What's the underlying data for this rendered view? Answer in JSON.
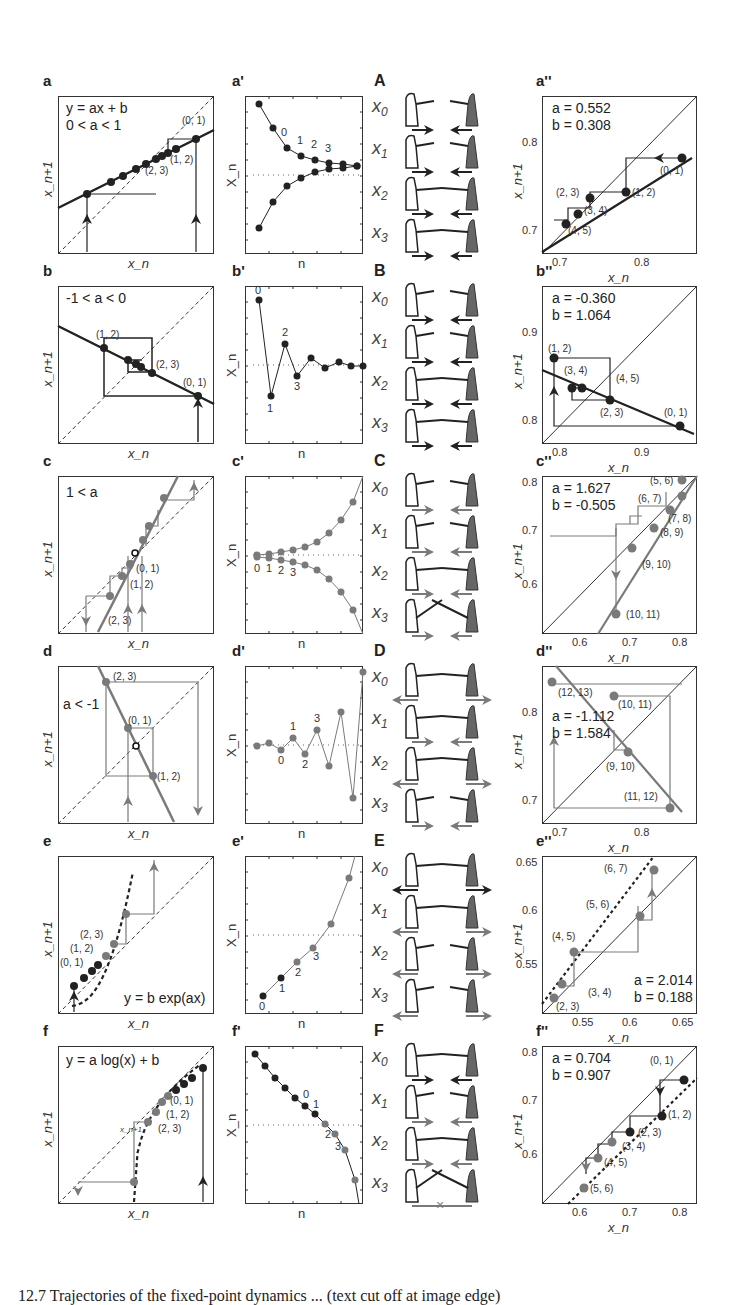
{
  "figure": {
    "caption": "12.7 Trajectories of the fixed-point dynamics ... (text cut off at image edge)",
    "axis_labels": {
      "cobweb_x": "x_n",
      "cobweb_y": "x_n+1",
      "time_x": "n",
      "time_y": "X_n"
    }
  },
  "rows": [
    {
      "cobweb": {
        "label": "a",
        "equation_line1": "y = ax + b",
        "equation_line2": "0 < a < 1",
        "points": [
          "(0, 1)",
          "(1, 2)",
          "(2, 3)"
        ]
      },
      "timeseries": {
        "label": "a'",
        "indices": [
          "0",
          "1",
          "2",
          "3"
        ]
      },
      "schematic": {
        "label": "A",
        "states": [
          "x0",
          "x1",
          "x2",
          "x3"
        ]
      },
      "fit": {
        "label": "a''",
        "a": "a = 0.552",
        "b": "b = 0.308",
        "xticks": [
          "0.7",
          "0.8"
        ],
        "yticks": [
          "0.8",
          "0.7"
        ],
        "points": [
          "(0, 1)",
          "(1, 2)",
          "(2, 3)",
          "(3, 4)",
          "(4, 5)"
        ]
      }
    },
    {
      "cobweb": {
        "label": "b",
        "equation_line1": "-1 < a < 0",
        "points": [
          "(1, 2)",
          "(2, 3)",
          "(0, 1)"
        ]
      },
      "timeseries": {
        "label": "b'",
        "indices": [
          "0",
          "1",
          "2",
          "3"
        ]
      },
      "schematic": {
        "label": "B",
        "states": [
          "x0",
          "x1",
          "x2",
          "x3"
        ]
      },
      "fit": {
        "label": "b''",
        "a": "a = -0.360",
        "b": "b = 1.064",
        "xticks": [
          "0.8",
          "0.9"
        ],
        "yticks": [
          "0.9",
          "0.8"
        ],
        "points": [
          "(1, 2)",
          "(3, 4)",
          "(4, 5)",
          "(2, 3)",
          "(0, 1)"
        ]
      }
    },
    {
      "cobweb": {
        "label": "c",
        "equation_line1": "1 < a",
        "points": [
          "(0, 1)",
          "(1, 2)",
          "(2, 3)"
        ]
      },
      "timeseries": {
        "label": "c'",
        "indices": [
          "0",
          "1",
          "2",
          "3"
        ]
      },
      "schematic": {
        "label": "C",
        "states": [
          "x0",
          "x1",
          "x2",
          "x3"
        ]
      },
      "fit": {
        "label": "c''",
        "a": "a = 1.627",
        "b": "b = -0.505",
        "xticks": [
          "0.6",
          "0.7",
          "0.8"
        ],
        "yticks": [
          "0.8",
          "0.7",
          "0.6"
        ],
        "points": [
          "(5, 6)",
          "(6, 7)",
          "(7, 8)",
          "(8, 9)",
          "(9, 10)",
          "(10, 11)"
        ]
      }
    },
    {
      "cobweb": {
        "label": "d",
        "equation_line1": "a < -1",
        "points": [
          "(2, 3)",
          "(0, 1)",
          "(1, 2)"
        ]
      },
      "timeseries": {
        "label": "d'",
        "indices": [
          "0",
          "1",
          "2",
          "3"
        ]
      },
      "schematic": {
        "label": "D",
        "states": [
          "x0",
          "x1",
          "x2",
          "x3"
        ]
      },
      "fit": {
        "label": "d''",
        "a": "a = -1.112",
        "b": "b = 1.584",
        "xticks": [
          "0.7",
          "0.8"
        ],
        "yticks": [
          "0.8",
          "0.7"
        ],
        "points": [
          "(12, 13)",
          "(10, 11)",
          "(9, 10)",
          "(11, 12)"
        ]
      }
    },
    {
      "cobweb": {
        "label": "e",
        "equation_line1": "y = b exp(ax)",
        "points": [
          "(2, 3)",
          "(1, 2)",
          "(0, 1)"
        ]
      },
      "timeseries": {
        "label": "e'",
        "indices": [
          "0",
          "1",
          "2",
          "3"
        ]
      },
      "schematic": {
        "label": "E",
        "states": [
          "x0",
          "x1",
          "x2",
          "x3"
        ]
      },
      "fit": {
        "label": "e''",
        "a": "a = 2.014",
        "b": "b = 0.188",
        "xticks": [
          "0.55",
          "0.6",
          "0.65"
        ],
        "yticks": [
          "0.65",
          "0.6",
          "0.55"
        ],
        "points": [
          "(6, 7)",
          "(5, 6)",
          "(4, 5)",
          "(3, 4)",
          "(2, 3)"
        ]
      }
    },
    {
      "cobweb": {
        "label": "f",
        "equation_line1": "y = a log(x) + b",
        "points": [
          "(0, 1)",
          "(1, 2)",
          "(2, 3)"
        ],
        "inline_label": "x_n+1"
      },
      "timeseries": {
        "label": "f'",
        "indices": [
          "0",
          "1",
          "2",
          "3"
        ]
      },
      "schematic": {
        "label": "F",
        "states": [
          "x0",
          "x1",
          "x2",
          "x3"
        ]
      },
      "fit": {
        "label": "f''",
        "a": "a = 0.704",
        "b": "b = 0.907",
        "xticks": [
          "0.6",
          "0.7",
          "0.8"
        ],
        "yticks": [
          "0.8",
          "0.7",
          "0.6"
        ],
        "points": [
          "(0, 1)",
          "(1, 2)",
          "(2, 3)",
          "(3, 4)",
          "(4, 5)",
          "(5, 6)"
        ]
      }
    }
  ],
  "colors": {
    "ink": "#222222",
    "gray_series": "#7a7a7a",
    "dark_figure": "#6a6a6a",
    "background": "#ffffff"
  }
}
